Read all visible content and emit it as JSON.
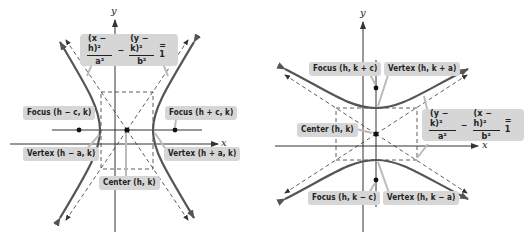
{
  "left_panel": {
    "title": "Horizontal transverse axis hyperbola",
    "axis_labels": {
      "x": "x",
      "y": "y"
    },
    "equation": {
      "term1_num": "(x − h)²",
      "term1_den": "a²",
      "minus": "−",
      "term2_num": "(y − k)²",
      "term2_den": "b²",
      "equals": "= 1"
    },
    "labels": {
      "focus_left": "Focus (h − c, k)",
      "focus_right": "Focus (h + c, k)",
      "vertex_left": "Vertex (h − a, k)",
      "vertex_right": "Vertex (h + a, k)",
      "center": "Center (h, k)"
    }
  },
  "right_panel": {
    "title": "Vertical transverse axis hyperbola",
    "axis_labels": {
      "x": "x",
      "y": "y"
    },
    "equation": {
      "term1_num": "(y − k)²",
      "term1_den": "a²",
      "minus": "−",
      "term2_num": "(x − h)²",
      "term2_den": "b²",
      "equals": "= 1"
    },
    "labels": {
      "focus_top": "Focus (h, k + c)",
      "vertex_top": "Vertex (h, k + a)",
      "center": "Center (h, k)",
      "focus_bottom": "Focus (h, k − c)",
      "vertex_bottom": "Vertex (h, k − a)"
    }
  },
  "colors": {
    "curve": "#555555",
    "axis": "#333333",
    "label_bg": "#d6d6d6",
    "point": "#111111"
  }
}
